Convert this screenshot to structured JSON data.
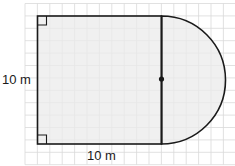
{
  "diagram": {
    "type": "composite-shape",
    "grid": {
      "color": "#d9d9d9",
      "x_start": 25,
      "y_start": 3.5,
      "spacing": 12.4,
      "cols": 17,
      "rows": 13
    },
    "square": {
      "x": 37.5,
      "y": 16,
      "width": 124,
      "height": 128,
      "fill": "#ebebeb",
      "stroke": "#1a1a1a"
    },
    "semicircle": {
      "center_x": 161.5,
      "center_y": 80,
      "radius": 64,
      "fill": "#ebebeb",
      "stroke": "#1a1a1a"
    },
    "diameter_line": {
      "x": 161.5,
      "y1": 16,
      "y2": 144
    },
    "center_dot": {
      "x": 161.5,
      "y": 79,
      "r": 2.6
    },
    "right_angle_markers": [
      {
        "position": "top-left",
        "x": 37.5,
        "y": 16,
        "size": 9
      },
      {
        "position": "bottom-left",
        "x": 37.5,
        "y": 135,
        "size": 9
      }
    ],
    "labels": {
      "height_label": "10 m",
      "width_label": "10 m"
    }
  }
}
